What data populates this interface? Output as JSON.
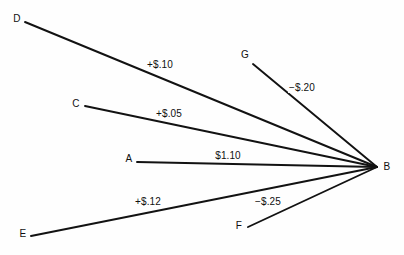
{
  "diagram": {
    "type": "hub-and-spoke-flow-diagram",
    "background_color": "#fefefe",
    "line_color": "#121212",
    "text_color": "#101010",
    "hub": {
      "id": "B",
      "label": "B",
      "x": 377,
      "y": 167,
      "label_x": 387,
      "label_y": 167
    },
    "nodes": [
      {
        "id": "D",
        "label": "D",
        "label_x": 17,
        "label_y": 19,
        "edge_x": 25,
        "edge_y": 22
      },
      {
        "id": "G",
        "label": "G",
        "label_x": 245,
        "label_y": 55,
        "edge_x": 253,
        "edge_y": 64
      },
      {
        "id": "C",
        "label": "C",
        "label_x": 76,
        "label_y": 104,
        "edge_x": 85,
        "edge_y": 106
      },
      {
        "id": "A",
        "label": "A",
        "label_x": 129,
        "label_y": 159,
        "edge_x": 137,
        "edge_y": 162
      },
      {
        "id": "E",
        "label": "E",
        "label_x": 23,
        "label_y": 234,
        "edge_x": 31,
        "edge_y": 236
      },
      {
        "id": "F",
        "label": "F",
        "label_x": 239,
        "label_y": 226,
        "edge_x": 248,
        "edge_y": 227
      }
    ],
    "edges": [
      {
        "from": "D",
        "to": "B",
        "value": "+$.10",
        "label_x": 160,
        "label_y": 65
      },
      {
        "from": "G",
        "to": "B",
        "value": "−$.20",
        "label_x": 302,
        "label_y": 88
      },
      {
        "from": "C",
        "to": "B",
        "value": "+$.05",
        "label_x": 169,
        "label_y": 114
      },
      {
        "from": "A",
        "to": "B",
        "value": "$1.10",
        "label_x": 228,
        "label_y": 156
      },
      {
        "from": "E",
        "to": "B",
        "value": "+$.12",
        "label_x": 148,
        "label_y": 202
      },
      {
        "from": "F",
        "to": "B",
        "value": "−$.25",
        "label_x": 268,
        "label_y": 202
      }
    ]
  }
}
